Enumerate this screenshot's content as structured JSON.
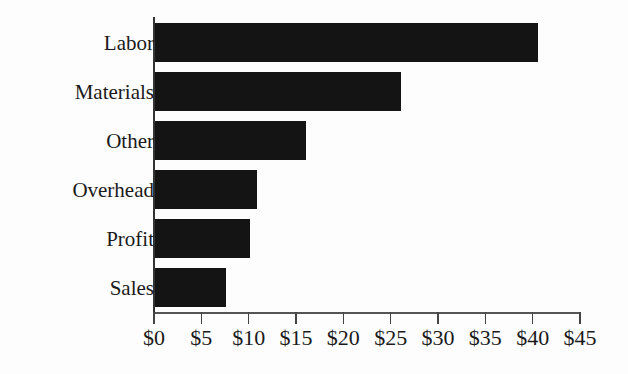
{
  "chart_data": {
    "type": "bar",
    "orientation": "horizontal",
    "title": "",
    "xlabel": "",
    "ylabel": "",
    "categories": [
      "Labor",
      "Materials",
      "Other",
      "Overhead",
      "Profit",
      "Sales"
    ],
    "values": [
      40.5,
      26,
      16,
      10.8,
      10,
      7.5
    ],
    "xlim": [
      0,
      45
    ],
    "x_ticks": [
      0,
      5,
      10,
      15,
      20,
      25,
      30,
      35,
      40,
      45
    ],
    "x_tick_labels": [
      "$0",
      "$5",
      "$10",
      "$15",
      "$20",
      "$25",
      "$30",
      "$35",
      "$40",
      "$45"
    ],
    "grid": false,
    "legend": null,
    "bar_color": "#141414"
  }
}
